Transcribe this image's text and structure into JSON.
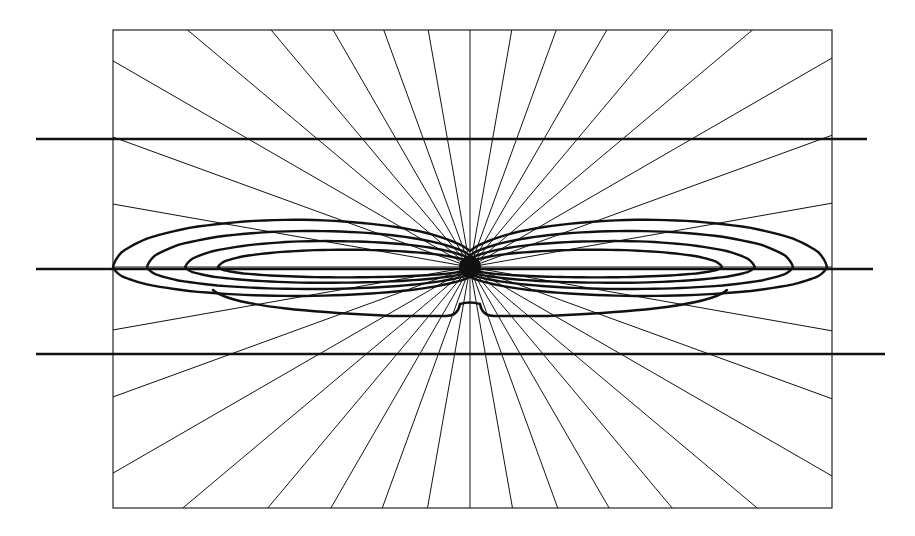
{
  "figure": {
    "title": "",
    "background_color": "#ffffff",
    "ink_color": "#111111",
    "width": 915,
    "height": 536
  },
  "chart_data": {
    "type": "line",
    "plot_style": "polar-radiation-pattern",
    "title": "",
    "subtitle": "",
    "xlabel": "",
    "ylabel": "",
    "grid": true,
    "legend": null,
    "legend_position": "none",
    "annotations": [],
    "origin": {
      "x": 470,
      "y": 267,
      "marker": "filled-dot",
      "marker_radius": 11
    },
    "frame": {
      "x0": 113,
      "y0": 30,
      "x1": 832,
      "y1": 508,
      "stroke_width": 1.1
    },
    "horizontal_rules": [
      {
        "name": "upper-reference-rule",
        "y": 139,
        "x_start": 36,
        "x_end": 867,
        "stroke_width": 2.6
      },
      {
        "name": "center-reference-rule",
        "y": 269,
        "x_start": 36,
        "x_end": 873,
        "stroke_width": 2.6
      },
      {
        "name": "lower-reference-rule",
        "y": 354,
        "x_start": 36,
        "x_end": 885,
        "stroke_width": 2.6
      }
    ],
    "radial_rays": {
      "count": 36,
      "stroke_width": 1.0,
      "angles_deg": [
        0,
        10,
        20,
        30,
        40,
        50,
        60,
        70,
        80,
        90,
        100,
        110,
        120,
        130,
        140,
        150,
        160,
        170,
        180,
        190,
        200,
        210,
        220,
        230,
        240,
        250,
        260,
        270,
        280,
        290,
        300,
        310,
        320,
        330,
        340,
        350
      ],
      "angular_step_deg": 10,
      "description": "rays from origin clipped at the rectangular frame"
    },
    "axis_ranges": {
      "theta_deg": [
        0,
        360
      ],
      "r_normalized": [
        0,
        1
      ]
    },
    "series": [
      {
        "name": "pattern-contour-1",
        "label": "outermost lobe",
        "stroke_width": 2.4,
        "x_half_extent": 357,
        "upper_peak_offset": -88,
        "lower_peak_offset": 54,
        "theta_deg": [
          0,
          10,
          20,
          30,
          40,
          50,
          60,
          70,
          80,
          90,
          100,
          110,
          120,
          130,
          140,
          150,
          160,
          170,
          180,
          190,
          200,
          210,
          220,
          230,
          240,
          250,
          260,
          270,
          280,
          290,
          300,
          310,
          320,
          330,
          340,
          350
        ],
        "r": [
          1.0,
          0.99,
          0.96,
          0.9,
          0.81,
          0.7,
          0.57,
          0.44,
          0.3,
          0.18,
          0.3,
          0.44,
          0.57,
          0.7,
          0.81,
          0.9,
          0.96,
          0.99,
          1.0,
          0.99,
          0.96,
          0.9,
          0.81,
          0.7,
          0.57,
          0.44,
          0.3,
          0.18,
          0.3,
          0.44,
          0.57,
          0.7,
          0.81,
          0.9,
          0.96,
          0.99
        ]
      },
      {
        "name": "pattern-contour-2",
        "label": "second lobe",
        "stroke_width": 2.4,
        "x_half_extent": 340,
        "upper_peak_offset": -72,
        "lower_peak_offset": 44,
        "theta_deg": [
          0,
          10,
          20,
          30,
          40,
          50,
          60,
          70,
          80,
          90,
          100,
          110,
          120,
          130,
          140,
          150,
          160,
          170,
          180,
          190,
          200,
          210,
          220,
          230,
          240,
          250,
          260,
          270,
          280,
          290,
          300,
          310,
          320,
          330,
          340,
          350
        ],
        "r": [
          0.95,
          0.94,
          0.91,
          0.85,
          0.76,
          0.65,
          0.53,
          0.4,
          0.27,
          0.16,
          0.27,
          0.4,
          0.53,
          0.65,
          0.76,
          0.85,
          0.91,
          0.94,
          0.95,
          0.94,
          0.91,
          0.85,
          0.76,
          0.65,
          0.53,
          0.4,
          0.27,
          0.16,
          0.27,
          0.4,
          0.53,
          0.65,
          0.76,
          0.85,
          0.91,
          0.94
        ]
      },
      {
        "name": "pattern-contour-3",
        "label": "third lobe",
        "stroke_width": 2.4,
        "x_half_extent": 320,
        "upper_peak_offset": -56,
        "lower_peak_offset": 34,
        "theta_deg": [
          0,
          10,
          20,
          30,
          40,
          50,
          60,
          70,
          80,
          90,
          100,
          110,
          120,
          130,
          140,
          150,
          160,
          170,
          180,
          190,
          200,
          210,
          220,
          230,
          240,
          250,
          260,
          270,
          280,
          290,
          300,
          310,
          320,
          330,
          340,
          350
        ],
        "r": [
          0.89,
          0.88,
          0.85,
          0.79,
          0.71,
          0.6,
          0.49,
          0.37,
          0.25,
          0.14,
          0.25,
          0.37,
          0.49,
          0.6,
          0.71,
          0.79,
          0.85,
          0.88,
          0.89,
          0.88,
          0.85,
          0.79,
          0.71,
          0.6,
          0.49,
          0.37,
          0.25,
          0.14,
          0.25,
          0.37,
          0.49,
          0.6,
          0.71,
          0.79,
          0.85,
          0.88
        ]
      },
      {
        "name": "pattern-contour-4",
        "label": "innermost lobe",
        "stroke_width": 2.4,
        "x_half_extent": 300,
        "upper_peak_offset": -40,
        "lower_peak_offset": 24,
        "theta_deg": [
          0,
          10,
          20,
          30,
          40,
          50,
          60,
          70,
          80,
          90,
          100,
          110,
          120,
          130,
          140,
          150,
          160,
          170,
          180,
          190,
          200,
          210,
          220,
          230,
          240,
          250,
          260,
          270,
          280,
          290,
          300,
          310,
          320,
          330,
          340,
          350
        ],
        "r": [
          0.84,
          0.83,
          0.8,
          0.74,
          0.66,
          0.56,
          0.45,
          0.34,
          0.22,
          0.12,
          0.22,
          0.34,
          0.45,
          0.56,
          0.66,
          0.74,
          0.8,
          0.83,
          0.84,
          0.83,
          0.8,
          0.74,
          0.66,
          0.56,
          0.45,
          0.34,
          0.22,
          0.12,
          0.22,
          0.34,
          0.45,
          0.56,
          0.66,
          0.74,
          0.8,
          0.83
        ]
      }
    ],
    "bottom_skirt": {
      "name": "lower-sidelobe-skirt",
      "stroke_width": 2.4,
      "y_floor": 316,
      "notch_center_x": 470,
      "notch_height": 12,
      "shoulder_left_x": 392,
      "shoulder_right_x": 548,
      "description": "flat minor-lobe skirt below the origin with a small central notch and raised shoulders"
    }
  }
}
